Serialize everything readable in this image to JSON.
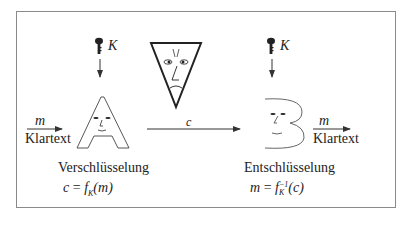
{
  "diagram": {
    "type": "symmetric-encryption-scheme",
    "encryption": {
      "key_label": "K",
      "input_label": "m",
      "input_caption": "Klartext",
      "title": "Verschlüsselung",
      "formula": {
        "lhs": "c",
        "eq": "=",
        "func": "f",
        "sub": "K",
        "arg": "(m)"
      }
    },
    "channel": {
      "label": "c"
    },
    "decryption": {
      "key_label": "K",
      "output_label": "m",
      "output_caption": "Klartext",
      "title": "Entschlüsselung",
      "formula": {
        "lhs": "m",
        "eq": "=",
        "func": "f",
        "sup": "−1",
        "sub": "K",
        "arg": "(c)"
      }
    },
    "colors": {
      "frame": "#8a8a8a",
      "ink": "#222222"
    }
  }
}
